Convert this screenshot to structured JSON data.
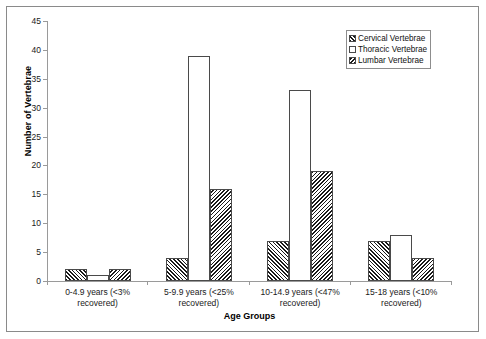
{
  "chart_data": {
    "type": "bar",
    "title": "",
    "xlabel": "Age Groups",
    "ylabel": "Number of Vertebrae",
    "ylim": [
      0,
      45
    ],
    "ytick_step": 5,
    "yticks": [
      "0",
      "5",
      "10",
      "15",
      "20",
      "25",
      "30",
      "35",
      "40",
      "45"
    ],
    "grid": false,
    "legend_position": "top-right",
    "categories": [
      "0-4.9 years (<3% recovered)",
      "5-9.9 years (<25% recovered)",
      "10-14.9 years (<47% recovered)",
      "15-18 years (<10% recovered)"
    ],
    "category_lines": [
      [
        "0-4.9 years (<3%",
        "recovered)"
      ],
      [
        "5-9.9 years (<25%",
        "recovered)"
      ],
      [
        "10-14.9 years (<47%",
        "recovered)"
      ],
      [
        "15-18 years (<10%",
        "recovered)"
      ]
    ],
    "series": [
      {
        "name": "Cervical Vertebrae",
        "pattern": "diagonal-hatch-forward",
        "values": [
          2,
          4,
          7,
          7
        ]
      },
      {
        "name": "Thoracic Vertebrae",
        "pattern": "light-stipple",
        "values": [
          1,
          39,
          33,
          8
        ]
      },
      {
        "name": "Lumbar Vertebrae",
        "pattern": "diagonal-hatch-back",
        "values": [
          2,
          16,
          19,
          4
        ]
      }
    ]
  },
  "legend": {
    "items": [
      {
        "label": "Cervical Vertebrae"
      },
      {
        "label": "Thoracic Vertebrae"
      },
      {
        "label": "Lumbar Vertebrae"
      }
    ]
  },
  "colors": {
    "frame": "#8a8a8a",
    "axis": "#9a9a9a",
    "bar_outline": "#4a4a4a",
    "hatch": "#1a1a1a",
    "text": "#111111",
    "background": "#ffffff"
  }
}
